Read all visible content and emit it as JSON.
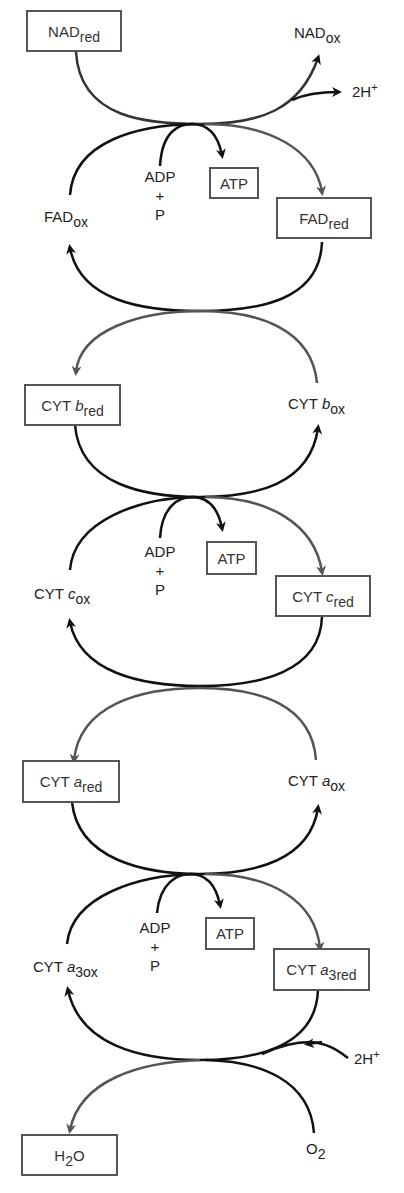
{
  "diagram": {
    "colors": {
      "black_stroke": "#111111",
      "gray_stroke": "#555555",
      "box_border": "#555555",
      "background": "#ffffff"
    },
    "nodes": {
      "nad_red": {
        "base": "NAD",
        "sub": "red",
        "boxed": true
      },
      "nad_ox": {
        "base": "NAD",
        "sub": "ox",
        "boxed": false
      },
      "h_top": {
        "base": "2H",
        "sup": "+",
        "boxed": false
      },
      "fad_ox": {
        "base": "FAD",
        "sub": "ox",
        "boxed": false
      },
      "fad_red": {
        "base": "FAD",
        "sub": "red",
        "boxed": true
      },
      "cytb_red": {
        "base": "CYT ",
        "ital": "b",
        "sub": "red",
        "boxed": true
      },
      "cytb_ox": {
        "base": "CYT ",
        "ital": "b",
        "sub": "ox",
        "boxed": false
      },
      "cytc_ox": {
        "base": "CYT ",
        "ital": "c",
        "sub": "ox",
        "boxed": false
      },
      "cytc_red": {
        "base": "CYT ",
        "ital": "c",
        "sub": "red",
        "boxed": true
      },
      "cyta_red": {
        "base": "CYT ",
        "ital": "a",
        "sub": "red",
        "boxed": true
      },
      "cyta_ox": {
        "base": "CYT ",
        "ital": "a",
        "sub": "ox",
        "boxed": false
      },
      "cyta3_ox": {
        "base": "CYT ",
        "ital": "a",
        "sub": "3ox",
        "boxed": false
      },
      "cyta3_red": {
        "base": "CYT ",
        "ital": "a",
        "sub": "3red",
        "boxed": true
      },
      "h_bottom": {
        "base": "2H",
        "sup": "+",
        "boxed": false
      },
      "o2": {
        "base": "O",
        "sub": "2",
        "boxed": false
      },
      "h2o": {
        "pre": "H",
        "sub": "2",
        "post": "O",
        "boxed": true
      }
    },
    "phosphorylation_sites": [
      {
        "adp": "ADP",
        "plus": "+",
        "p": "P",
        "atp": "ATP"
      },
      {
        "adp": "ADP",
        "plus": "+",
        "p": "P",
        "atp": "ATP"
      },
      {
        "adp": "ADP",
        "plus": "+",
        "p": "P",
        "atp": "ATP"
      }
    ]
  }
}
